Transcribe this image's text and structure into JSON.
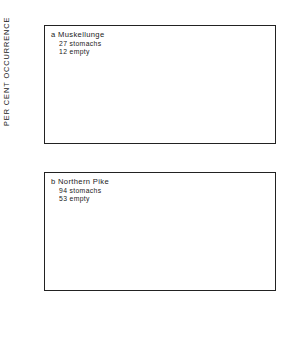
{
  "axis": {
    "ylabel": "PER CENT OCCURRENCE",
    "yticks": [
      "0",
      "10",
      "20",
      "30",
      "40"
    ]
  },
  "chart_data": {
    "type": "bar",
    "title": "",
    "xlabel": "",
    "ylabel": "PER CENT OCCURRENCE",
    "ylim": [
      0,
      40
    ],
    "grid": false,
    "legend": "none",
    "categories": [
      "Crayfish",
      "Dragonfly larvae",
      "Mayfly larvae",
      "Yellow perch",
      "Walleye",
      "Iowa darter",
      "Catfids",
      "Umbrids",
      "Cyprinids",
      "Unidentified fish",
      "Wood duck"
    ],
    "category_lines": [
      [
        "Crayfish"
      ],
      [
        "Dragonfly",
        "larvae"
      ],
      [
        "Mayfly",
        "larvae"
      ],
      [
        "Yellow perch"
      ],
      [
        "Walleye"
      ],
      [
        "Iowa darter"
      ],
      [
        "Catfids"
      ],
      [
        "Umbrids"
      ],
      [
        "Cyprinids"
      ],
      [
        "Unidentified",
        "fish"
      ],
      [
        "Wood duck"
      ]
    ],
    "panels": [
      {
        "key": "a",
        "title": "a  Muskellunge",
        "sub1": "27 stomachs",
        "sub2": "12 empty",
        "values": [
          20,
          0,
          0,
          33,
          27,
          0,
          7,
          7,
          27,
          0,
          3
        ]
      },
      {
        "key": "b",
        "title": "b  Northern Pike",
        "sub1": "94 stomachs",
        "sub2": "53 empty",
        "values": [
          8,
          5,
          5,
          17,
          7.5,
          2.5,
          4.5,
          2,
          22,
          45,
          0
        ]
      }
    ]
  }
}
